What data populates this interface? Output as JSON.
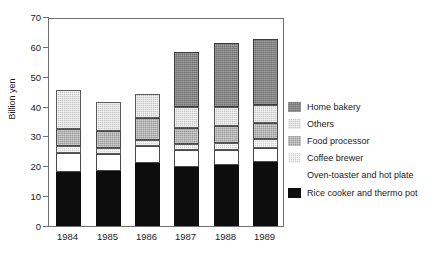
{
  "chart_data": {
    "type": "bar",
    "stacked": true,
    "title": "",
    "xlabel": "",
    "ylabel": "Billion yen",
    "ylim": [
      0,
      70
    ],
    "yticks": [
      0,
      10,
      20,
      30,
      40,
      50,
      60,
      70
    ],
    "ytick_labels": [
      "0",
      "10",
      "20",
      "30",
      "40",
      "50",
      "60",
      "70"
    ],
    "grid": false,
    "legend_position": "right",
    "categories": [
      "1984",
      "1985",
      "1986",
      "1987",
      "1988",
      "1989"
    ],
    "series": [
      {
        "name": "Rice cooker and thermo pot",
        "fill": "f-black",
        "color": "#0d0d0d",
        "values": [
          18.0,
          18.3,
          21.1,
          19.8,
          20.6,
          21.6
        ]
      },
      {
        "name": "Oven-toaster and hot plate",
        "fill": "f-white",
        "color": "#ffffff",
        "values": [
          6.5,
          5.8,
          5.7,
          5.7,
          4.8,
          4.5
        ]
      },
      {
        "name": "Coffee brewer",
        "fill": "f-silver",
        "color": "#cfcfcf",
        "values": [
          2.3,
          1.9,
          2.1,
          2.1,
          2.3,
          2.9
        ]
      },
      {
        "name": "Food processor",
        "fill": "f-midgray",
        "color": "#9a9a9a",
        "values": [
          5.8,
          5.9,
          7.2,
          5.3,
          5.9,
          5.4
        ]
      },
      {
        "name": "Others",
        "fill": "f-lightgray",
        "color": "#c6c6c6",
        "values": [
          12.8,
          9.6,
          8.2,
          6.8,
          6.4,
          6.2
        ]
      },
      {
        "name": "Home bakery",
        "fill": "f-darkgray",
        "color": "#707070",
        "values": [
          0.0,
          0.0,
          0.0,
          18.7,
          21.2,
          22.0
        ]
      }
    ],
    "totals": [
      45.4,
      41.5,
      44.3,
      58.4,
      61.2,
      62.6
    ],
    "legend_order": [
      "Home bakery",
      "Others",
      "Food processor",
      "Coffee brewer",
      "Oven-toaster and hot plate",
      "Rice cooker and thermo pot"
    ]
  },
  "legend": {
    "items": [
      {
        "label": "Home bakery",
        "fill": "f-darkgray"
      },
      {
        "label": "Others",
        "fill": "f-lightgray"
      },
      {
        "label": "Food processor",
        "fill": "f-midgray"
      },
      {
        "label": "Coffee brewer",
        "fill": "f-silver"
      },
      {
        "label": "Oven-toaster and hot plate",
        "fill": "f-white"
      },
      {
        "label": "Rice cooker and thermo pot",
        "fill": "f-black"
      }
    ]
  }
}
